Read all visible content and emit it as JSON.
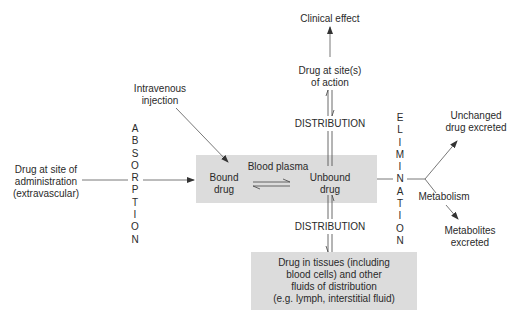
{
  "diagram": {
    "nodes": {
      "clinical_effect": "Clinical effect",
      "drug_site_action_1": "Drug at site(s)",
      "drug_site_action_2": "of action",
      "iv_injection_1": "Intravenous",
      "iv_injection_2": "injection",
      "drug_admin_1": "Drug at site of",
      "drug_admin_2": "administration",
      "drug_admin_3": "(extravascular)",
      "blood_plasma": "Blood plasma",
      "bound_1": "Bound",
      "bound_2": "drug",
      "unbound_1": "Unbound",
      "unbound_2": "drug",
      "tissues_1": "Drug in tissues (including",
      "tissues_2": "blood cells) and other",
      "tissues_3": "fluids of distribution",
      "tissues_4": "(e.g. lymph, interstitial fluid)",
      "unchanged_1": "Unchanged",
      "unchanged_2": "drug excreted",
      "metabolism": "Metabolism",
      "metabolites_1": "Metabolites",
      "metabolites_2": "excreted"
    },
    "process_labels": {
      "distribution_upper": "DISTRIBUTION",
      "distribution_lower": "DISTRIBUTION",
      "absorption": [
        "A",
        "B",
        "S",
        "O",
        "R",
        "P",
        "T",
        "I",
        "O",
        "N"
      ],
      "elimination": [
        "E",
        "L",
        "I",
        "M",
        "I",
        "N",
        "A",
        "T",
        "I",
        "O",
        "N"
      ]
    },
    "colors": {
      "box_fill": "#dcdcdc",
      "line": "#444444",
      "text": "#2a2a2a"
    }
  }
}
